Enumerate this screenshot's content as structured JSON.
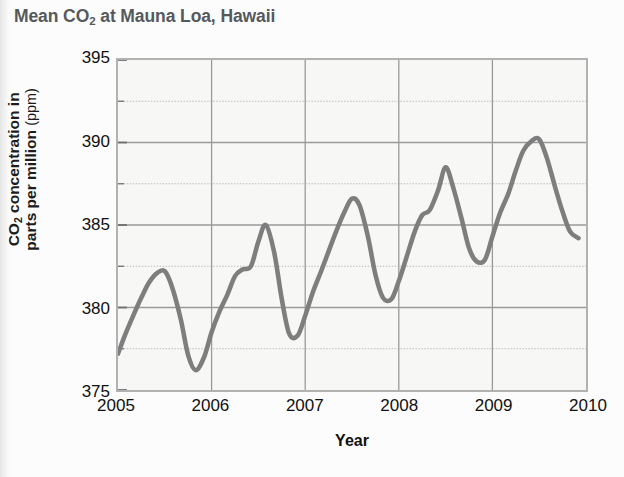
{
  "chart_data": {
    "type": "line",
    "title": "Mean CO2 at Mauna Loa, Hawaii",
    "title_parts": {
      "pre": "Mean CO",
      "sub": "2",
      "post": " at Mauna Loa, Hawaii"
    },
    "xlabel": "Year",
    "ylabel": "CO2 concentration in parts per million (ppm)",
    "ylabel_parts": {
      "pre": "CO",
      "sub": "2",
      "post": " concentration in",
      "line2": "parts per million",
      "unit": "(ppm)"
    },
    "xlim": [
      2005,
      2010
    ],
    "ylim": [
      375,
      395
    ],
    "x_ticks": [
      "2005",
      "2006",
      "2007",
      "2008",
      "2009",
      "2010"
    ],
    "x_tick_values": [
      2005,
      2006,
      2007,
      2008,
      2009,
      2010
    ],
    "y_ticks": [
      "375",
      "380",
      "385",
      "390",
      "395"
    ],
    "y_tick_values": [
      375,
      380,
      385,
      390,
      395
    ],
    "y_minor_step": 2.5,
    "grid": "both-major-and-minor-horizontal-plus-year-verticals",
    "legend": "none",
    "line_color": "#7e7e7e",
    "grid_color": "#9a9a9a",
    "plot_bg": "#f7f7f5",
    "frame_color": "#b2b2b2",
    "series": [
      {
        "name": "Mean CO2 concentration",
        "x": [
          2005.0,
          2005.08,
          2005.17,
          2005.25,
          2005.33,
          2005.42,
          2005.5,
          2005.58,
          2005.67,
          2005.75,
          2005.83,
          2005.92,
          2006.0,
          2006.08,
          2006.17,
          2006.25,
          2006.33,
          2006.42,
          2006.5,
          2006.58,
          2006.67,
          2006.75,
          2006.83,
          2006.92,
          2007.0,
          2007.08,
          2007.17,
          2007.25,
          2007.33,
          2007.42,
          2007.5,
          2007.58,
          2007.67,
          2007.75,
          2007.83,
          2007.92,
          2008.0,
          2008.08,
          2008.17,
          2008.25,
          2008.33,
          2008.42,
          2008.5,
          2008.58,
          2008.67,
          2008.75,
          2008.83,
          2008.92,
          2009.0,
          2009.08,
          2009.17,
          2009.25,
          2009.33,
          2009.42,
          2009.5,
          2009.58,
          2009.67,
          2009.75,
          2009.83,
          2009.92
        ],
        "y": [
          377.2,
          378.4,
          379.6,
          380.6,
          381.5,
          382.1,
          382.2,
          381.2,
          379.3,
          377.1,
          376.2,
          377.0,
          378.5,
          379.7,
          380.8,
          381.9,
          382.3,
          382.5,
          384.0,
          385.0,
          383.3,
          380.5,
          378.4,
          378.3,
          379.5,
          380.9,
          382.2,
          383.4,
          384.6,
          385.8,
          386.6,
          386.2,
          384.3,
          382.0,
          380.6,
          380.5,
          381.6,
          383.0,
          384.6,
          385.6,
          385.9,
          387.1,
          388.5,
          387.3,
          385.4,
          383.6,
          382.8,
          382.9,
          384.3,
          385.7,
          386.9,
          388.3,
          389.5,
          390.1,
          390.2,
          389.1,
          387.3,
          385.8,
          384.6,
          384.2
        ]
      }
    ],
    "annotations": []
  }
}
